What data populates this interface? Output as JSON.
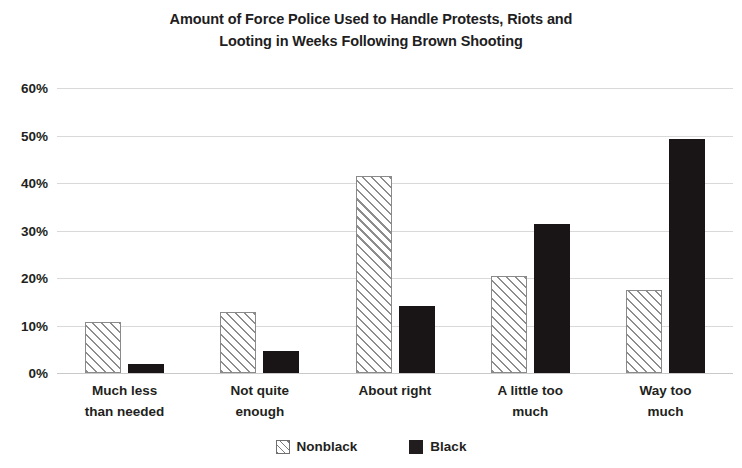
{
  "chart_data": {
    "type": "bar",
    "title": "Amount of Force Police Used to Handle Protests, Riots and Looting in Weeks Following Brown Shooting",
    "title_lines": [
      "Amount of Force Police Used to Handle Protests, Riots and",
      "Looting in Weeks Following Brown Shooting"
    ],
    "xlabel": "",
    "ylabel": "",
    "ylim": [
      0,
      60
    ],
    "ytick_values": [
      60,
      50,
      40,
      30,
      20,
      10,
      0
    ],
    "ytick_labels": [
      "60%",
      "50%",
      "40%",
      "30%",
      "20%",
      "10%",
      "0%"
    ],
    "grid": true,
    "legend_position": "bottom",
    "categories": [
      "Much less than needed",
      "Not quite enough",
      "About right",
      "A little too much",
      "Way too much"
    ],
    "category_lines": [
      [
        "Much less",
        "than needed"
      ],
      [
        "Not quite",
        "enough"
      ],
      [
        "About right",
        ""
      ],
      [
        "A little too",
        "much"
      ],
      [
        "Way too",
        "much"
      ]
    ],
    "series": [
      {
        "name": "Nonblack",
        "fill": "diagonal-hatch",
        "color": "#8d8d8d",
        "values": [
          10.7,
          12.8,
          41.4,
          20.4,
          17.4
        ]
      },
      {
        "name": "Black",
        "fill": "solid",
        "color": "#191516",
        "values": [
          2.0,
          4.7,
          14.2,
          31.3,
          49.3
        ]
      }
    ]
  },
  "legend": {
    "items": [
      {
        "label": "Nonblack",
        "swatch": "hatched-square-icon"
      },
      {
        "label": "Black",
        "swatch": "filled-square-icon"
      }
    ]
  }
}
